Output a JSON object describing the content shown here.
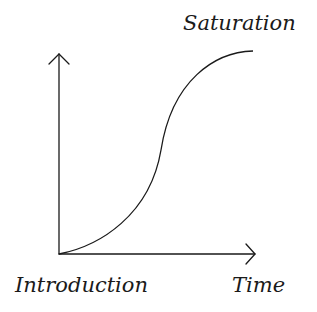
{
  "diagram": {
    "type": "s-curve",
    "labels": {
      "top_right": "Saturation",
      "origin": "Introduction",
      "x_axis": "Time"
    },
    "colors": {
      "stroke": "#1a1a1a",
      "background": "#ffffff"
    },
    "geometry": {
      "origin": [
        59,
        254
      ],
      "y_axis_top": [
        59,
        54
      ],
      "x_axis_end": [
        255,
        254
      ],
      "curve_end": [
        253,
        51
      ],
      "inflection": [
        161,
        150
      ]
    }
  }
}
